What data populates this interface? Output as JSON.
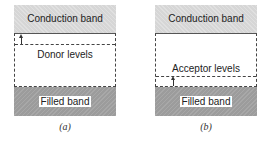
{
  "panels": [
    {
      "id": "a",
      "conduction_band": "Conduction band",
      "levels_label": "Donor levels",
      "filled_band": "Filled band",
      "caption": "(a)"
    },
    {
      "id": "b",
      "conduction_band": "Conduction band",
      "levels_label": "Acceptor levels",
      "filled_band": "Filled band",
      "caption": "(b)"
    }
  ]
}
